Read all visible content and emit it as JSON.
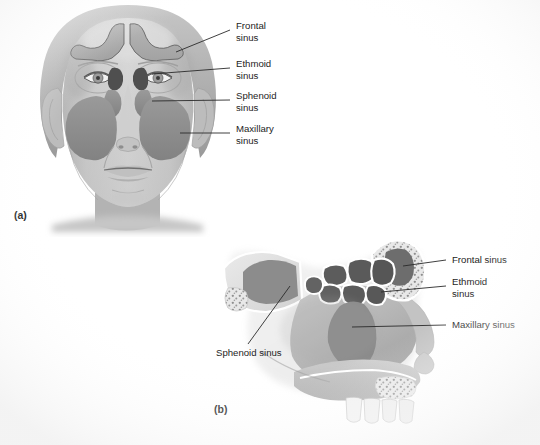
{
  "figure": {
    "background_color": "#ffffff",
    "panels": [
      {
        "tag": "(a)",
        "view": "anterior view of face",
        "labels": [
          {
            "id": "frontal",
            "line1": "Frontal",
            "line2": "sinus"
          },
          {
            "id": "ethmoid",
            "line1": "Ethmoid",
            "line2": "sinus"
          },
          {
            "id": "sphenoid",
            "line1": "Sphenoid",
            "line2": "sinus"
          },
          {
            "id": "maxillary",
            "line1": "Maxillary",
            "line2": "sinus"
          }
        ]
      },
      {
        "tag": "(b)",
        "view": "sagittal section of nasal cavity",
        "labels": [
          {
            "id": "frontal",
            "line1": "Frontal sinus",
            "line2": ""
          },
          {
            "id": "ethmoid",
            "line1": "Ethmoid",
            "line2": "sinus"
          },
          {
            "id": "maxillary",
            "line1": "Maxillary sinus",
            "line2": ""
          },
          {
            "id": "sphenoid",
            "line1": "Sphenoid sinus",
            "line2": ""
          }
        ]
      }
    ]
  },
  "colors": {
    "background": "#ffffff",
    "skin_light": "#d6d6d6",
    "skin_mid": "#c2c2c2",
    "skin_shadow": "#a9a9a9",
    "hair": "#b4b4b4",
    "sinus_mid_gray": "#8d8d8d",
    "sinus_dark_gray": "#5c5c5c",
    "bone_light": "#e4e4e4",
    "bone_outline": "#ffffff",
    "teeth": "#efefef",
    "leader_line": "#2a2a2a",
    "label_text": "#1d1d1d"
  }
}
